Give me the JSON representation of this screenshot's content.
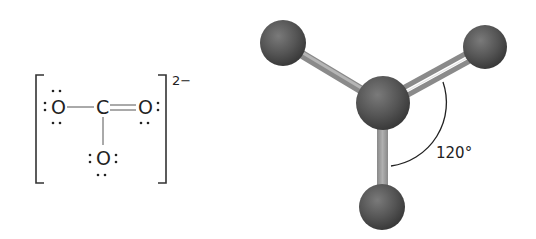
{
  "lewis_structure": {
    "charge": "2−",
    "atoms": {
      "left_oxygen": "O",
      "carbon": "C",
      "right_oxygen": "O",
      "bottom_oxygen": "O"
    },
    "bonds": [
      {
        "from": "left_oxygen",
        "to": "carbon",
        "order": 1
      },
      {
        "from": "carbon",
        "to": "right_oxygen",
        "order": 2
      },
      {
        "from": "carbon",
        "to": "bottom_oxygen",
        "order": 1
      }
    ]
  },
  "ball_and_stick_model": {
    "bond_angle_label": "120°",
    "colors": {
      "atom": "#555555",
      "bond": "#9a9a9a",
      "arc": "#222222"
    }
  }
}
